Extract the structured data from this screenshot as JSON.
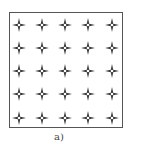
{
  "figure": {
    "label": "a)",
    "grid": {
      "rows": 5,
      "cols": 5,
      "marker": "four-point-star-icon"
    },
    "colors": {
      "marker": "#333333",
      "frame": "#555555"
    }
  }
}
